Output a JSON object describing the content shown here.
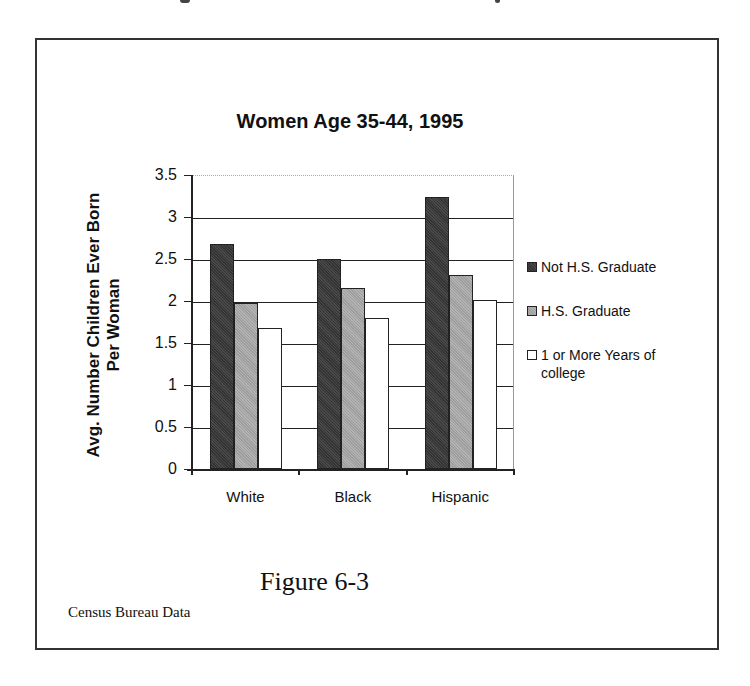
{
  "chart_data": {
    "type": "bar",
    "title": "Women Age 35-44, 1995",
    "xlabel": "",
    "ylabel": "Avg. Number Children Ever Born Per Woman",
    "ylabel_lines": [
      "Avg. Number Children Ever Born",
      "Per Woman"
    ],
    "categories": [
      "White",
      "Black",
      "Hispanic"
    ],
    "series": [
      {
        "name": "Not H.S. Graduate",
        "values": [
          2.68,
          2.5,
          3.24
        ],
        "color": "#3a3a3a"
      },
      {
        "name": "H.S. Graduate",
        "values": [
          1.98,
          2.16,
          2.31
        ],
        "color": "#a9a9a9"
      },
      {
        "name": "1 or More Years of college",
        "values": [
          1.68,
          1.8,
          2.01
        ],
        "color": "#ffffff"
      }
    ],
    "ylim": [
      0,
      3.5
    ],
    "yticks": [
      "0",
      "0.5",
      "1",
      "1.5",
      "2",
      "2.5",
      "3",
      "3.5"
    ],
    "grid": true,
    "legend_position": "right"
  },
  "legend": {
    "items": [
      {
        "label": "Not H.S. Graduate"
      },
      {
        "label": "H.S. Graduate"
      },
      {
        "label_line1": "1 or More Years of",
        "label_line2": "college"
      }
    ]
  },
  "caption": "Figure 6-3",
  "source": "Census Bureau Data"
}
